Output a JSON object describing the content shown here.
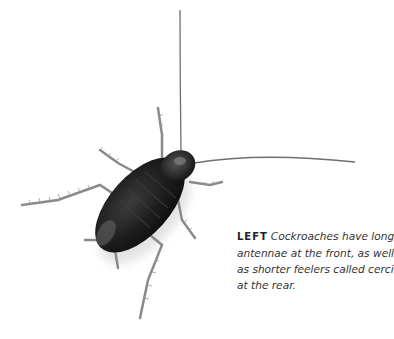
{
  "figure": {
    "subject": "cockroach",
    "colors": {
      "body": "#1a1a1a",
      "body_highlight": "#5a5a5a",
      "legs": "#7a7a7a",
      "antennae": "#6a6a6a",
      "background": "#ffffff"
    }
  },
  "caption": {
    "lead": "LEFT",
    "lines": [
      "Cockroaches have long",
      "antennae at the front, as well",
      "as shorter feelers called cerci",
      "at the rear."
    ]
  }
}
